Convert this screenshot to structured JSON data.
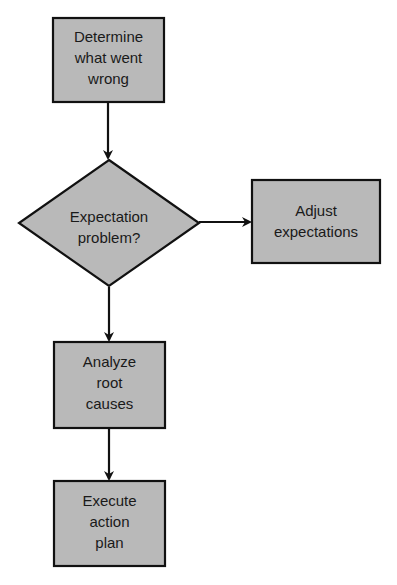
{
  "colors": {
    "node_fill": "#b9b9b9",
    "stroke": "#111111",
    "text": "#1a1a1a",
    "background": "#ffffff"
  },
  "nodes": {
    "determine": {
      "shape": "rectangle",
      "lines": [
        "Determine",
        "what went",
        "wrong"
      ]
    },
    "decision": {
      "shape": "diamond",
      "lines": [
        "Expectation",
        "problem?"
      ]
    },
    "adjust": {
      "shape": "rectangle",
      "lines": [
        "Adjust",
        "expectations"
      ]
    },
    "analyze": {
      "shape": "rectangle",
      "lines": [
        "Analyze",
        "root",
        "causes"
      ]
    },
    "execute": {
      "shape": "rectangle",
      "lines": [
        "Execute",
        "action",
        "plan"
      ]
    }
  },
  "edges": [
    {
      "from": "determine",
      "to": "decision"
    },
    {
      "from": "decision",
      "to": "adjust"
    },
    {
      "from": "decision",
      "to": "analyze"
    },
    {
      "from": "analyze",
      "to": "execute"
    }
  ]
}
